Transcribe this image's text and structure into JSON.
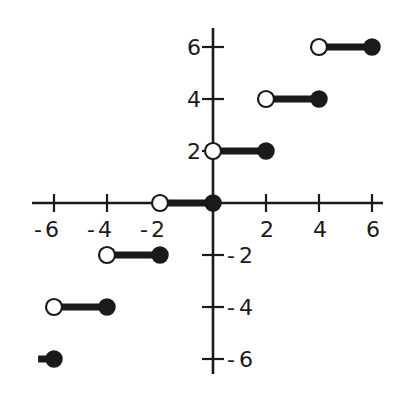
{
  "chart_data": {
    "type": "scatter",
    "subtype": "step-function (greatest-integer style)",
    "title": "",
    "xlabel": "",
    "ylabel": "",
    "xlim": [
      -6.8,
      6.3
    ],
    "ylim": [
      -6.6,
      6.6
    ],
    "grid": false,
    "legend": null,
    "x_ticks": [
      -6,
      -4,
      -2,
      2,
      4,
      6
    ],
    "x_tick_labels": [
      "-6",
      "-4",
      "-2",
      "2",
      "4",
      "6"
    ],
    "y_ticks": [
      6,
      4,
      2,
      -2,
      -4,
      -6
    ],
    "y_tick_labels": [
      "6",
      "4",
      "2",
      "-2",
      "-4",
      "-6"
    ],
    "segments": [
      {
        "x_start": -6.6,
        "x_end": -6,
        "y": -6,
        "open_left": false,
        "closed_right": true,
        "left_marker": "none"
      },
      {
        "x_start": -6,
        "x_end": -4,
        "y": -4,
        "open_left": true,
        "closed_right": true
      },
      {
        "x_start": -4,
        "x_end": -2,
        "y": -2,
        "open_left": true,
        "closed_right": true
      },
      {
        "x_start": -2,
        "x_end": 0,
        "y": 0,
        "open_left": true,
        "closed_right": true
      },
      {
        "x_start": 0,
        "x_end": 2,
        "y": 2,
        "open_left": true,
        "closed_right": true
      },
      {
        "x_start": 2,
        "x_end": 4,
        "y": 4,
        "open_left": true,
        "closed_right": true
      },
      {
        "x_start": 4,
        "x_end": 6,
        "y": 6,
        "open_left": true,
        "closed_right": true
      }
    ],
    "colors": {
      "line": "#1a1a1a",
      "open_marker_fill": "#ffffff",
      "closed_marker_fill": "#1a1a1a",
      "background": "#ffffff"
    }
  }
}
